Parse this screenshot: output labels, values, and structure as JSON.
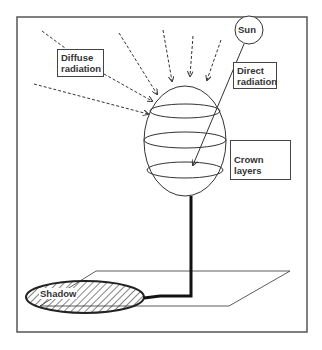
{
  "diagram": {
    "type": "tree-radiation-schematic",
    "labels": {
      "sun": "Sun",
      "diffuse": "Diffuse radiation",
      "diffuse_line1": "Diffuse",
      "diffuse_line2": "radiation",
      "direct_line1": "Direct",
      "direct_line2": "radiation",
      "crown": "Crown layers",
      "shadow": "Shadow"
    },
    "colors": {
      "line": "#333333",
      "frame": "#555555",
      "background": "#ffffff"
    }
  }
}
